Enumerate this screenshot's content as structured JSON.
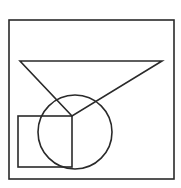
{
  "diagram": {
    "width": 181,
    "height": 188,
    "background": "#ffffff",
    "stroke": "#2a2a2a",
    "stroke_width": 1.6,
    "shapes": {
      "outer_square": {
        "x": 9,
        "y": 20,
        "width": 165,
        "height": 159
      },
      "triangle": {
        "points": "20,61 162,61 72,116"
      },
      "circle": {
        "cx": 75,
        "cy": 132,
        "r": 37
      },
      "small_square": {
        "x": 18,
        "y": 116,
        "width": 54,
        "height": 51
      }
    }
  }
}
